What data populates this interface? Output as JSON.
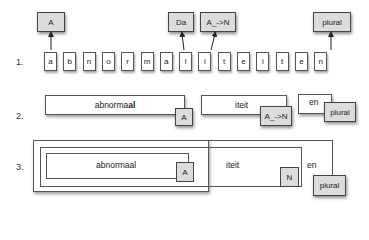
{
  "row_labels": [
    "1.",
    "2.",
    "3."
  ],
  "row1": {
    "letters": [
      "a",
      "b",
      "n",
      "o",
      "r",
      "m",
      "a",
      "l",
      "i",
      "t",
      "e",
      "i",
      "t",
      "e",
      "n"
    ],
    "tags": [
      {
        "label": "A",
        "points_to_letter_index": 0
      },
      {
        "label": "Da",
        "points_to_letter_index": 7
      },
      {
        "label": "A_->N",
        "points_to_letter_index": 8
      },
      {
        "label": "plural",
        "points_to_letter_index": 13
      }
    ]
  },
  "row2": {
    "segments": [
      {
        "text_pre": "abnorma",
        "text_bold": "al",
        "tag": "A"
      },
      {
        "text": "iteit",
        "tag": "A_->N"
      },
      {
        "text": "en",
        "tag": "plural"
      }
    ]
  },
  "row3": {
    "inner_text": "abnormaal",
    "inner_tag": "A",
    "middle_text": "iteit",
    "middle_tag": "N",
    "outer_text": "en",
    "outer_tag": "plural"
  }
}
